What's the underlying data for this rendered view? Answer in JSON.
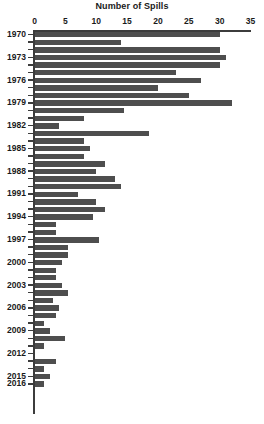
{
  "chart_data": {
    "type": "bar",
    "orientation": "horizontal",
    "title": "Number of Spills",
    "xlabel": "",
    "ylabel": "",
    "xlim": [
      0,
      35
    ],
    "xticks": [
      0,
      5,
      10,
      15,
      20,
      25,
      30,
      35
    ],
    "grid": false,
    "legend": null,
    "bar_color": "#4e4e4e",
    "axis_color": "#3c3c3c",
    "label_every_n_years": 3,
    "categories": [
      "1970",
      "1971",
      "1972",
      "1973",
      "1974",
      "1975",
      "1976",
      "1977",
      "1978",
      "1979",
      "1980",
      "1981",
      "1982",
      "1983",
      "1984",
      "1985",
      "1986",
      "1987",
      "1988",
      "1989",
      "1990",
      "1991",
      "1992",
      "1993",
      "1994",
      "1995",
      "1996",
      "1997",
      "1998",
      "1999",
      "2000",
      "2001",
      "2002",
      "2003",
      "2004",
      "2005",
      "2006",
      "2007",
      "2008",
      "2009",
      "2010",
      "2011",
      "2012",
      "2013",
      "2014",
      "2015",
      "2016"
    ],
    "values": [
      30,
      14,
      30,
      31,
      30,
      23,
      27,
      20,
      25,
      32,
      14.5,
      8,
      4,
      18.5,
      8,
      9,
      8,
      11.5,
      10,
      13,
      14,
      7,
      10,
      11.5,
      9.5,
      3.5,
      3.5,
      10.5,
      5.5,
      5.5,
      4.5,
      3.5,
      3.5,
      4.5,
      5.5,
      3,
      4,
      3.5,
      1.5,
      2.5,
      5,
      1.5,
      0,
      3.5,
      1.5,
      2.5,
      1.5
    ],
    "visible_year_labels": [
      "1970",
      "1973",
      "1976",
      "1979",
      "1982",
      "1985",
      "1988",
      "1991",
      "1994",
      "1997",
      "2000",
      "2003",
      "2006",
      "2009",
      "2012",
      "2015",
      "2016"
    ]
  }
}
